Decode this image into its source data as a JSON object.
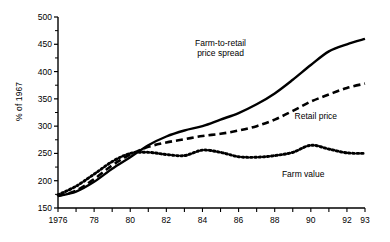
{
  "chart_data": {
    "type": "line",
    "title": "",
    "subtitle": "",
    "xlabel": "",
    "ylabel": "% of 1967",
    "xlim": [
      1976,
      1993
    ],
    "ylim": [
      150,
      500
    ],
    "grid": false,
    "legend_position": "inline-annotations",
    "x": [
      1976,
      1977,
      1978,
      1979,
      1980,
      1981,
      1982,
      1983,
      1984,
      1985,
      1986,
      1987,
      1988,
      1989,
      1990,
      1991,
      1992,
      1993
    ],
    "x_tick_labels": [
      "1976",
      "",
      "78",
      "",
      "80",
      "",
      "82",
      "",
      "84",
      "",
      "86",
      "",
      "88",
      "",
      "90",
      "",
      "92",
      "93"
    ],
    "y_tick_labels": [
      "150",
      "200",
      "250",
      "300",
      "350",
      "400",
      "450",
      "500"
    ],
    "y_ticks": [
      150,
      200,
      250,
      300,
      350,
      400,
      450,
      500
    ],
    "y_minor_step": 25,
    "series": [
      {
        "name": "Farm-to-retail price spread",
        "style": "solid",
        "color": "#000000",
        "values": [
          172,
          180,
          198,
          222,
          243,
          265,
          281,
          292,
          300,
          312,
          324,
          340,
          360,
          385,
          412,
          437,
          450,
          460
        ]
      },
      {
        "name": "Retail price",
        "style": "dashed",
        "color": "#000000",
        "values": [
          172,
          182,
          203,
          228,
          248,
          262,
          270,
          276,
          282,
          286,
          292,
          300,
          312,
          328,
          345,
          358,
          370,
          378
        ]
      },
      {
        "name": "Farm value",
        "style": "dotted",
        "color": "#000000",
        "values": [
          174,
          190,
          212,
          235,
          250,
          252,
          248,
          246,
          256,
          252,
          244,
          243,
          246,
          252,
          265,
          258,
          251,
          250
        ]
      }
    ],
    "annotations": [
      {
        "text_line1": "Farm-to-retail",
        "text_line2": "price spread",
        "series": "Farm-to-retail price spread"
      },
      {
        "text_line1": "Retail price",
        "text_line2": "",
        "series": "Retail price"
      },
      {
        "text_line1": "Farm value",
        "text_line2": "",
        "series": "Farm value"
      }
    ]
  }
}
